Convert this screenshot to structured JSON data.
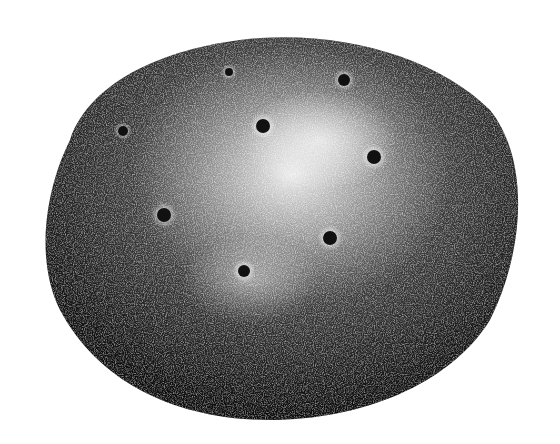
{
  "image": {
    "subject": "engraved illustration of a potato tuber",
    "background_color": "#ffffff",
    "ink_color": "#111111",
    "highlight_color": "#f2f2f2",
    "eyes": [
      {
        "cx": 123,
        "cy": 131,
        "r": 5
      },
      {
        "cx": 229,
        "cy": 72,
        "r": 4
      },
      {
        "cx": 263,
        "cy": 126,
        "r": 7
      },
      {
        "cx": 344,
        "cy": 80,
        "r": 6
      },
      {
        "cx": 374,
        "cy": 157,
        "r": 7
      },
      {
        "cx": 164,
        "cy": 215,
        "r": 7
      },
      {
        "cx": 330,
        "cy": 238,
        "r": 7
      },
      {
        "cx": 244,
        "cy": 271,
        "r": 6
      }
    ]
  }
}
